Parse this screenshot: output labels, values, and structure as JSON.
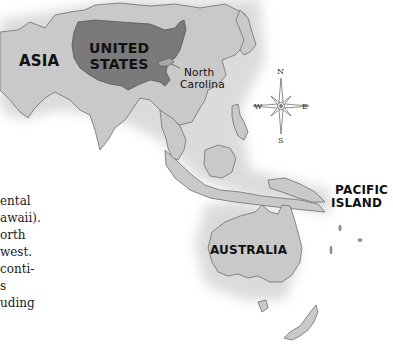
{
  "map": {
    "labels": {
      "asia": "ASIA",
      "united_states_line1": "UNITED",
      "united_states_line2": "STATES",
      "north_carolina_line1": "North",
      "north_carolina_line2": "Carolina",
      "pacific_island_line1": "PACIFIC",
      "pacific_island_line2": "ISLAND",
      "australia": "AUSTRALIA"
    },
    "compass": {
      "icon": "compass-rose-icon",
      "north": "N",
      "south": "S",
      "east": "E",
      "west": "W"
    },
    "colors": {
      "land": "#c9c9c9",
      "land_outline": "#6e6e6e",
      "united_states": "#7a7a7a",
      "north_carolina": "#a8a8a8",
      "ocean": "#ffffff"
    }
  },
  "body_text": {
    "lines": [
      "ental",
      "awaii).",
      "orth",
      "west.",
      "conti-",
      "s",
      "uding"
    ]
  }
}
